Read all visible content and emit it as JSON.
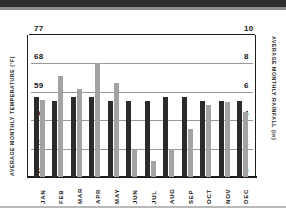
{
  "chart_data": {
    "type": "bar",
    "title": "",
    "subtitle": "",
    "categories": [
      "JAN",
      "FEB",
      "MAR",
      "APR",
      "MAY",
      "JUN",
      "JUL",
      "AUG",
      "SEP",
      "OCT",
      "NOV",
      "DEC"
    ],
    "series": [
      {
        "name": "Average Monthly Temperature",
        "unit": "°F",
        "axis": "left",
        "color": "#2b2b2b",
        "values": [
          57.5,
          56,
          57.5,
          57.5,
          56,
          56,
          56,
          57.5,
          57.5,
          56,
          56,
          56
        ]
      },
      {
        "name": "Average Monthly Rainfall",
        "unit": "in",
        "axis": "right",
        "color": "#a3a3a3",
        "values": [
          5.4,
          7.1,
          6.2,
          8.0,
          6.6,
          1.9,
          1.1,
          2.0,
          3.4,
          5.1,
          5.3,
          4.6
        ]
      }
    ],
    "xlabel": "",
    "ylabel": "AVERAGE MONTHLY TEMPERATURE (°F)",
    "ylabel_right": "AVERAGE MONTHLY RAINFALL (in)",
    "ylim": [
      32,
      77
    ],
    "ylim_right": [
      0,
      10
    ],
    "yticks_left": [
      "32",
      "41",
      "50",
      "59",
      "68",
      "77"
    ],
    "yticks_right": [
      "0",
      "2",
      "4",
      "6",
      "8",
      "10"
    ],
    "grid": true,
    "legend": "none"
  },
  "axes": {
    "left_title": "AVERAGE MONTHLY TEMPERATURE (°F)",
    "right_title": "AVERAGE MONTHLY RAINFALL (in)",
    "left_ticks": [
      {
        "label": "77"
      },
      {
        "label": "68"
      },
      {
        "label": "59"
      },
      {
        "label": "50"
      },
      {
        "label": "41"
      },
      {
        "label": "32"
      }
    ],
    "right_ticks": [
      {
        "label": "10"
      },
      {
        "label": "8"
      },
      {
        "label": "6"
      },
      {
        "label": "4"
      },
      {
        "label": "2"
      },
      {
        "label": "0"
      }
    ]
  },
  "months": [
    {
      "label": "JAN"
    },
    {
      "label": "FEB"
    },
    {
      "label": "MAR"
    },
    {
      "label": "APR"
    },
    {
      "label": "MAY"
    },
    {
      "label": "JUN"
    },
    {
      "label": "JUL"
    },
    {
      "label": "AUG"
    },
    {
      "label": "SEP"
    },
    {
      "label": "OCT"
    },
    {
      "label": "NOV"
    },
    {
      "label": "DEC"
    }
  ],
  "colors": {
    "temperature_bar": "#2b2b2b",
    "rainfall_bar": "#a3a3a3",
    "gridline": "#9a9a9a",
    "frame": "#1d1d1d",
    "background": "#ffffff"
  }
}
